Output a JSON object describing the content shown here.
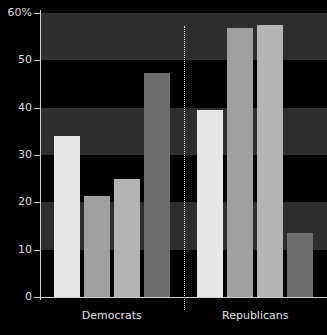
{
  "chart_data": {
    "type": "bar",
    "title": "",
    "xlabel": "",
    "ylabel": "",
    "ylim": [
      0,
      60
    ],
    "yticks": [
      0,
      10,
      20,
      30,
      40,
      50,
      60
    ],
    "ytick_labels": [
      "0",
      "10",
      "20",
      "30",
      "40",
      "50",
      "60%"
    ],
    "grid": "alternating horizontal bands",
    "legend": "none",
    "categories": [
      "Democrats",
      "Republicans"
    ],
    "series": [
      {
        "name": "Series 1",
        "color": "#e8e8e8",
        "values": [
          34.0,
          39.5
        ]
      },
      {
        "name": "Series 2",
        "color": "#a0a0a0",
        "values": [
          21.3,
          56.8
        ]
      },
      {
        "name": "Series 3",
        "color": "#b4b4b4",
        "values": [
          25.0,
          57.5
        ]
      },
      {
        "name": "Series 4",
        "color": "#6e6e6e",
        "values": [
          47.3,
          13.5
        ]
      }
    ],
    "bars": [
      {
        "group": "Democrats",
        "index": 0,
        "value": 34.0,
        "color": "#e8e8e8"
      },
      {
        "group": "Democrats",
        "index": 1,
        "value": 21.3,
        "color": "#a0a0a0"
      },
      {
        "group": "Democrats",
        "index": 2,
        "value": 25.0,
        "color": "#b4b4b4"
      },
      {
        "group": "Democrats",
        "index": 3,
        "value": 47.3,
        "color": "#6e6e6e"
      },
      {
        "group": "Republicans",
        "index": 0,
        "value": 39.5,
        "color": "#e8e8e8"
      },
      {
        "group": "Republicans",
        "index": 1,
        "value": 56.8,
        "color": "#a0a0a0"
      },
      {
        "group": "Republicans",
        "index": 2,
        "value": 57.5,
        "color": "#b4b4b4"
      },
      {
        "group": "Republicans",
        "index": 3,
        "value": 13.5,
        "color": "#6e6e6e"
      }
    ],
    "bands": [
      {
        "from": 10,
        "to": 20,
        "color": "#2e2e2e"
      },
      {
        "from": 30,
        "to": 40,
        "color": "#2e2e2e"
      },
      {
        "from": 50,
        "to": 60,
        "color": "#2e2e2e"
      }
    ],
    "divider": {
      "value": "group-separator",
      "style": "dotted",
      "color": "#e6e6e6"
    },
    "background_color": "#000000",
    "axis_color": "#cfcfcf",
    "text_color": "#dcdcdc"
  }
}
